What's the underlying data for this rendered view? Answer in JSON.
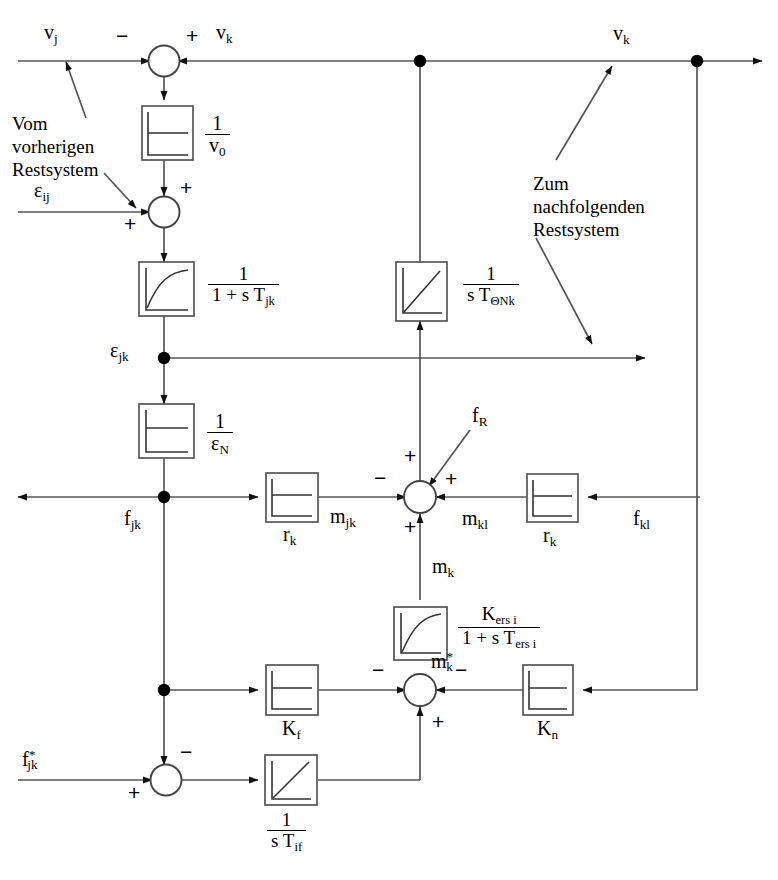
{
  "diagram": {
    "type": "control-block-diagram",
    "language": "de",
    "stroke_color": "#444444",
    "fill_color": "#000000",
    "background": "#ffffff"
  },
  "annotations": {
    "from_previous": "Vom\nvorherigen\nRestsystem",
    "from_previous_l1": "Vom",
    "from_previous_l2": "vorherigen",
    "from_previous_l3": "Restsystem",
    "to_next_l1": "Zum",
    "to_next_l2": "nachfolgenden",
    "to_next_l3": "Restsystem"
  },
  "signals": {
    "v_j": "v",
    "v_j_sub": "j",
    "v_k_top_left": "v",
    "v_k_top_left_sub": "k",
    "v_k_top_right": "v",
    "v_k_top_right_sub": "k",
    "eps_ij": "ε",
    "eps_ij_sub": "ij",
    "eps_jk": "ε",
    "eps_jk_sub": "jk",
    "f_jk": "f",
    "f_jk_sub": "jk",
    "f_jk_star": "f",
    "f_jk_star_sub": "jk",
    "f_jk_star_sup": "*",
    "f_R": "f",
    "f_R_sub": "R",
    "f_kl": "f",
    "f_kl_sub": "kl",
    "m_jk": "m",
    "m_jk_sub": "jk",
    "m_kl": "m",
    "m_kl_sub": "kl",
    "m_k": "m",
    "m_k_sub": "k",
    "m_k_star": "m",
    "m_k_star_sub": "k",
    "m_k_star_sup": "*"
  },
  "blocks": [
    {
      "id": "v0",
      "kind": "step-gain",
      "label_num": "1",
      "label_den": "v",
      "label_den_sub": "0"
    },
    {
      "id": "pt1_jk",
      "kind": "pt1-lag",
      "label_num": "1",
      "label_den": "1 + s T",
      "label_den_sub": "jk"
    },
    {
      "id": "epsN",
      "kind": "step-gain",
      "label_num": "1",
      "label_den": "ε",
      "label_den_sub": "N"
    },
    {
      "id": "int_onk",
      "kind": "integrator",
      "label_num": "1",
      "label_den": "s T",
      "label_den_sub": "ΘNk"
    },
    {
      "id": "rk_left",
      "kind": "step-gain",
      "label": "r",
      "label_sub": "k"
    },
    {
      "id": "rk_right",
      "kind": "step-gain",
      "label": "r",
      "label_sub": "k"
    },
    {
      "id": "pt1_ers",
      "kind": "pt1-lag",
      "label_num": "K",
      "label_num_sub": "ers i",
      "label_den": "1 + s T",
      "label_den_sub": "ers i"
    },
    {
      "id": "kf",
      "kind": "step-gain",
      "label": "K",
      "label_sub": "f"
    },
    {
      "id": "kn",
      "kind": "step-gain",
      "label": "K",
      "label_sub": "n"
    },
    {
      "id": "int_if",
      "kind": "integrator",
      "label_num": "1",
      "label_den": "s T",
      "label_den_sub": "if"
    }
  ],
  "summing_junctions": [
    {
      "id": "sum_vk",
      "inputs": [
        "-",
        "+"
      ]
    },
    {
      "id": "sum_eps",
      "inputs": [
        "+",
        "+"
      ]
    },
    {
      "id": "sum_mid",
      "inputs": [
        "-",
        "+",
        "+",
        "+"
      ]
    },
    {
      "id": "sum_mstar",
      "inputs": [
        "-",
        "-",
        "+"
      ]
    },
    {
      "id": "sum_fjk",
      "inputs": [
        "-",
        "+"
      ]
    }
  ],
  "signs": {
    "minus": "−",
    "plus": "+"
  }
}
